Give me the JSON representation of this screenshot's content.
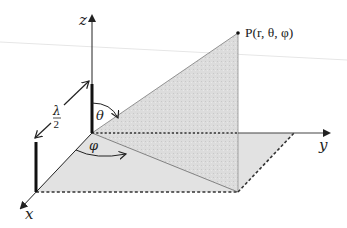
{
  "diagram": {
    "labels": {
      "z_axis": "z",
      "y_axis": "y",
      "x_axis": "x",
      "point": "P(r, θ, φ)",
      "theta": "θ",
      "phi": "φ",
      "length_num": "λ",
      "length_den": "2"
    },
    "colors": {
      "axis": "#222222",
      "fill_vertical": "#d9d9d9",
      "fill_floor": "#e0e0e0",
      "edge": "#888888",
      "dashed": "#333333"
    }
  }
}
